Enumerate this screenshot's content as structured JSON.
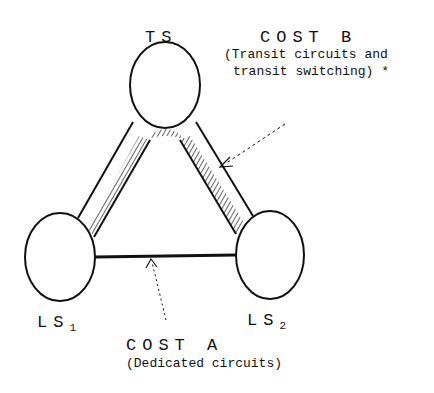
{
  "nodes": {
    "ts": {
      "label": "TS"
    },
    "ls1": {
      "label": "LS",
      "sub": "1"
    },
    "ls2": {
      "label": "LS",
      "sub": "2"
    }
  },
  "cost_b": {
    "title": "COST B",
    "line1": "(Transit circuits and",
    "line2": "transit switching) *"
  },
  "cost_a": {
    "title": "COST A",
    "desc": "(Dedicated circuits)"
  },
  "colors": {
    "stroke": "#111111",
    "background": "#ffffff"
  }
}
